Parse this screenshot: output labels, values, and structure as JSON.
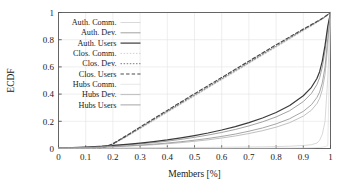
{
  "chart_data": {
    "type": "line",
    "title": "",
    "xlabel": "Members [%]",
    "ylabel": "ECDF",
    "xlim": [
      0,
      1
    ],
    "ylim": [
      0,
      1
    ],
    "xticks": [
      "0",
      "0.1",
      "0.2",
      "0.3",
      "0.4",
      "0.5",
      "0.6",
      "0.7",
      "0.8",
      "0.9",
      "1"
    ],
    "xtick_values": [
      0,
      0.1,
      0.2,
      0.3,
      0.4,
      0.5,
      0.6,
      0.7,
      0.8,
      0.9,
      1
    ],
    "yticks": [
      "0",
      "0.2",
      "0.4",
      "0.6",
      "0.8",
      "1"
    ],
    "ytick_values": [
      0,
      0.2,
      0.4,
      0.6,
      0.8,
      1
    ],
    "grid": true,
    "legend_position": "upper-left-inside",
    "x": [
      0,
      0.05,
      0.1,
      0.15,
      0.16,
      0.2,
      0.25,
      0.3,
      0.35,
      0.4,
      0.45,
      0.5,
      0.55,
      0.6,
      0.65,
      0.7,
      0.75,
      0.8,
      0.85,
      0.9,
      0.93,
      0.95,
      0.96,
      0.97,
      0.98,
      0.99,
      1
    ],
    "series": [
      {
        "name": "Auth. Comm.",
        "style": "solid",
        "color": "#c9c9c9",
        "width": 0.7,
        "values": [
          0.003,
          0.003,
          0.004,
          0.004,
          0.004,
          0.005,
          0.005,
          0.006,
          0.006,
          0.007,
          0.007,
          0.008,
          0.008,
          0.009,
          0.01,
          0.011,
          0.012,
          0.014,
          0.017,
          0.022,
          0.028,
          0.04,
          0.06,
          0.105,
          0.2,
          0.52,
          1.0
        ]
      },
      {
        "name": "Auth. Dev.",
        "style": "solid",
        "color": "#8a8a8a",
        "width": 0.8,
        "values": [
          0.004,
          0.006,
          0.009,
          0.013,
          0.014,
          0.019,
          0.026,
          0.034,
          0.043,
          0.054,
          0.067,
          0.082,
          0.099,
          0.118,
          0.14,
          0.166,
          0.196,
          0.232,
          0.278,
          0.345,
          0.405,
          0.47,
          0.52,
          0.6,
          0.72,
          0.88,
          1.0
        ]
      },
      {
        "name": "Auth. Users",
        "style": "solid",
        "color": "#3a3a3a",
        "width": 1.2,
        "values": [
          0.004,
          0.007,
          0.011,
          0.016,
          0.017,
          0.023,
          0.031,
          0.04,
          0.051,
          0.063,
          0.078,
          0.095,
          0.114,
          0.136,
          0.161,
          0.19,
          0.224,
          0.265,
          0.316,
          0.388,
          0.45,
          0.515,
          0.565,
          0.645,
          0.76,
          0.9,
          1.0
        ]
      },
      {
        "name": "Clos. Comm.",
        "style": "dotted",
        "color": "#bdbdbd",
        "width": 0.7,
        "values": [
          0.002,
          0.002,
          0.002,
          0.002,
          0.002,
          0.03,
          0.085,
          0.145,
          0.205,
          0.265,
          0.325,
          0.385,
          0.445,
          0.505,
          0.565,
          0.625,
          0.685,
          0.745,
          0.805,
          0.865,
          0.9,
          0.925,
          0.938,
          0.95,
          0.965,
          0.982,
          1.0
        ]
      },
      {
        "name": "Clos. Dev.",
        "style": "dotted",
        "color": "#7d7d7d",
        "width": 1.0,
        "values": [
          0.002,
          0.002,
          0.002,
          0.002,
          0.002,
          0.032,
          0.09,
          0.15,
          0.212,
          0.272,
          0.332,
          0.392,
          0.452,
          0.512,
          0.572,
          0.632,
          0.692,
          0.752,
          0.812,
          0.872,
          0.906,
          0.93,
          0.942,
          0.954,
          0.968,
          0.984,
          1.0
        ]
      },
      {
        "name": "Clos. Users",
        "style": "dashed",
        "color": "#4a4a4a",
        "width": 1.2,
        "values": [
          0.002,
          0.002,
          0.002,
          0.002,
          0.002,
          0.035,
          0.095,
          0.157,
          0.219,
          0.28,
          0.341,
          0.402,
          0.462,
          0.522,
          0.582,
          0.642,
          0.702,
          0.762,
          0.82,
          0.878,
          0.911,
          0.934,
          0.945,
          0.957,
          0.97,
          0.985,
          1.0
        ]
      },
      {
        "name": "Hubs Comm.",
        "style": "solid",
        "color": "#dcdcdc",
        "width": 0.7,
        "values": [
          0.001,
          0.001,
          0.001,
          0.001,
          0.001,
          0.001,
          0.001,
          0.001,
          0.001,
          0.002,
          0.002,
          0.002,
          0.002,
          0.002,
          0.003,
          0.003,
          0.003,
          0.004,
          0.004,
          0.005,
          0.006,
          0.007,
          0.008,
          0.01,
          0.013,
          0.02,
          1.0
        ]
      },
      {
        "name": "Hubs Dev.",
        "style": "solid",
        "color": "#b0b0b0",
        "width": 0.8,
        "values": [
          0.003,
          0.004,
          0.006,
          0.009,
          0.009,
          0.012,
          0.017,
          0.022,
          0.028,
          0.035,
          0.043,
          0.053,
          0.064,
          0.077,
          0.092,
          0.11,
          0.131,
          0.157,
          0.19,
          0.238,
          0.282,
          0.33,
          0.368,
          0.432,
          0.545,
          0.76,
          1.0
        ]
      },
      {
        "name": "Hubs Users",
        "style": "solid",
        "color": "#9b9b9b",
        "width": 0.9,
        "values": [
          0.003,
          0.005,
          0.007,
          0.01,
          0.011,
          0.014,
          0.019,
          0.025,
          0.032,
          0.04,
          0.05,
          0.061,
          0.074,
          0.089,
          0.106,
          0.127,
          0.151,
          0.181,
          0.219,
          0.273,
          0.322,
          0.375,
          0.415,
          0.484,
          0.6,
          0.81,
          1.0
        ]
      }
    ]
  },
  "legend": {
    "items": [
      {
        "label": "Auth. Comm."
      },
      {
        "label": "Auth. Dev."
      },
      {
        "label": "Auth. Users"
      },
      {
        "label": "Clos. Comm."
      },
      {
        "label": "Clos. Dev."
      },
      {
        "label": "Clos. Users"
      },
      {
        "label": "Hubs Comm."
      },
      {
        "label": "Hubs Dev."
      },
      {
        "label": "Hubs Users"
      }
    ]
  },
  "style": {
    "axis_color": "#555555",
    "grid_color": "#e3e3e3",
    "background": "#ffffff"
  }
}
